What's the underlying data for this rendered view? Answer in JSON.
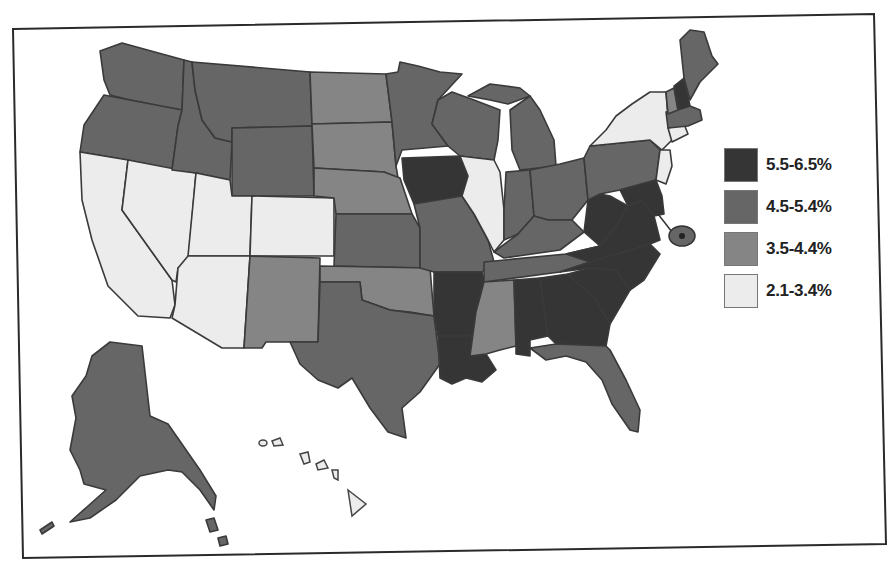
{
  "map": {
    "type": "choropleth",
    "region": "United States",
    "legend": [
      {
        "label": "5.5-6.5%",
        "color": "#353535",
        "class": "c1"
      },
      {
        "label": "4.5-5.4%",
        "color": "#666666",
        "class": "c2"
      },
      {
        "label": "3.5-4.4%",
        "color": "#858585",
        "class": "c3"
      },
      {
        "label": "2.1-3.4%",
        "color": "#ececec",
        "class": "c4"
      }
    ],
    "states": {
      "5.5-6.5%": [
        "IA",
        "AR",
        "LA",
        "AL",
        "GA",
        "SC",
        "NC",
        "VA",
        "NH",
        "MD"
      ],
      "4.5-5.4%": [
        "WA",
        "OR",
        "ID",
        "MT",
        "WY",
        "MN",
        "WI",
        "MI",
        "KS",
        "MO",
        "TX",
        "TN",
        "KY",
        "OH",
        "IN",
        "PA",
        "ME",
        "MA",
        "FL",
        "AK",
        "WV"
      ],
      "3.5-4.4%": [
        "ND",
        "SD",
        "NE",
        "NM",
        "OK",
        "MS",
        "VT",
        "DE",
        "DC"
      ],
      "2.1-3.4%": [
        "CA",
        "NV",
        "UT",
        "AZ",
        "CO",
        "IL",
        "NY",
        "NJ",
        "CT",
        "RI",
        "HI"
      ]
    }
  }
}
